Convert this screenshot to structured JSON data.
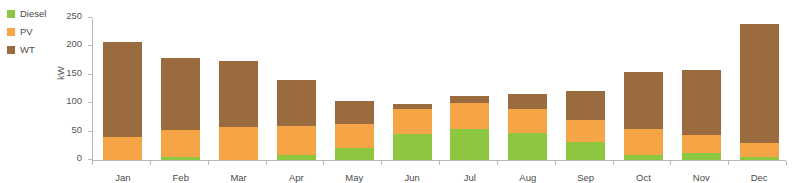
{
  "legend": {
    "items": [
      {
        "label": "Diesel",
        "color": "#8DC63F"
      },
      {
        "label": "PV",
        "color": "#F6A546"
      },
      {
        "label": "WT",
        "color": "#9A6B3F"
      }
    ]
  },
  "axes": {
    "ylabel": "kW",
    "yticks": [
      0,
      50,
      100,
      150,
      200,
      250
    ],
    "ylim": [
      0,
      250
    ],
    "xlabel": ""
  },
  "chart_data": {
    "type": "bar",
    "stacked": true,
    "title": "",
    "xlabel": "",
    "ylabel": "kW",
    "ylim": [
      0,
      250
    ],
    "yticks": [
      0,
      50,
      100,
      150,
      200,
      250
    ],
    "grid": false,
    "legend_position": "top-left",
    "categories": [
      "Jan",
      "Feb",
      "Mar",
      "Apr",
      "May",
      "Jun",
      "Jul",
      "Aug",
      "Sep",
      "Oct",
      "Nov",
      "Dec"
    ],
    "series": [
      {
        "name": "Diesel",
        "color": "#8DC63F",
        "values": [
          0,
          5,
          0,
          8,
          22,
          45,
          55,
          47,
          32,
          9,
          12,
          6
        ]
      },
      {
        "name": "PV",
        "color": "#F6A546",
        "values": [
          40,
          48,
          58,
          52,
          42,
          45,
          45,
          43,
          38,
          46,
          32,
          24
        ]
      },
      {
        "name": "WT",
        "color": "#9A6B3F",
        "values": [
          168,
          127,
          117,
          80,
          40,
          9,
          12,
          27,
          52,
          100,
          114,
          210
        ]
      }
    ],
    "totals": [
      208,
      180,
      175,
      140,
      104,
      99,
      112,
      117,
      122,
      155,
      158,
      240
    ]
  }
}
